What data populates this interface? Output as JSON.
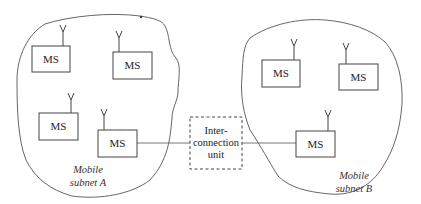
{
  "diagram": {
    "subnet_a": {
      "label_line1": "Mobile",
      "label_line2": "subnet A"
    },
    "subnet_b": {
      "label_line1": "Mobile",
      "label_line2": "subnet B"
    },
    "interconnection_unit": {
      "line1": "Inter-",
      "line2": "connection",
      "line3": "unit"
    },
    "mobile_stations": [
      {
        "label": "MS",
        "subnet": "A"
      },
      {
        "label": "MS",
        "subnet": "A"
      },
      {
        "label": "MS",
        "subnet": "A"
      },
      {
        "label": "MS",
        "subnet": "A"
      },
      {
        "label": "MS",
        "subnet": "B"
      },
      {
        "label": "MS",
        "subnet": "B"
      },
      {
        "label": "MS",
        "subnet": "B"
      }
    ],
    "colors": {
      "stroke": "#444444",
      "background": "#ffffff"
    }
  }
}
